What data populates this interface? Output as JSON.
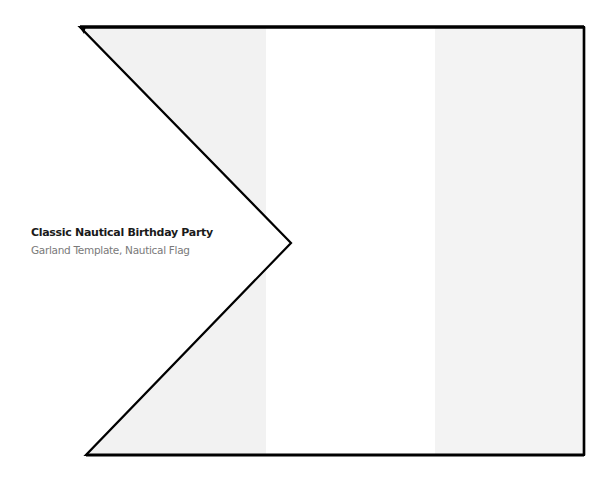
{
  "caption": {
    "title": "Classic Nautical Birthday Party",
    "subtitle": "Garland Template, Nautical Flag"
  },
  "flag": {
    "shape": "swallowtail-pennant",
    "stripes": [
      "light-gray",
      "white",
      "light-gray"
    ],
    "colors": {
      "stripe_gray": "#f2f2f2",
      "stripe_white": "#ffffff",
      "outline": "#000000"
    }
  }
}
